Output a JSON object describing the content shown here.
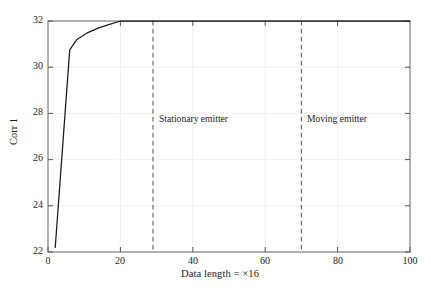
{
  "chart_data": {
    "type": "line",
    "title": "",
    "xlabel": "Data length = ×16",
    "ylabel": "Corr 1",
    "xlim": [
      0,
      100
    ],
    "ylim": [
      22,
      32
    ],
    "xticks": [
      0,
      20,
      40,
      60,
      80,
      100
    ],
    "yticks": [
      22,
      24,
      26,
      28,
      30,
      32
    ],
    "grid": true,
    "legend": "none",
    "series": [
      {
        "name": "Corr 1",
        "color": "#1a1a1a",
        "x": [
          2,
          6,
          8,
          11,
          14,
          17,
          20,
          100
        ],
        "y": [
          22.2,
          30.75,
          31.2,
          31.5,
          31.7,
          31.85,
          32.0,
          32.0
        ]
      }
    ],
    "vlines": [
      {
        "x": 29,
        "style": "dashed",
        "color": "#555555",
        "label": "Stationary emitter"
      },
      {
        "x": 70,
        "style": "dashed",
        "color": "#555555",
        "label": "Moving emitter"
      }
    ],
    "annotations": [
      {
        "text": "Stationary emitter",
        "x": 31,
        "y": 27.6
      },
      {
        "text": "Moving emitter",
        "x": 72,
        "y": 27.6
      }
    ]
  },
  "axes": {
    "xlabel": "Data length = ×16",
    "ylabel": "Corr 1",
    "xtick_labels": [
      "0",
      "20",
      "40",
      "60",
      "80",
      "100"
    ],
    "ytick_labels": [
      "22",
      "24",
      "26",
      "28",
      "30",
      "32"
    ]
  },
  "annotations": {
    "stationary": "Stationary emitter",
    "moving": "Moving emitter"
  },
  "colors": {
    "axis": "#6f6f6f",
    "grid": "#e9e9e9",
    "curve": "#1a1a1a",
    "vline": "#595959",
    "text": "#1b1b1b",
    "background": "#ffffff"
  }
}
